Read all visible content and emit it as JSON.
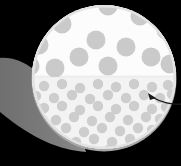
{
  "figure": {
    "name": "magnified-inset-callout",
    "width": 181,
    "height": 166,
    "background_color": "#000000"
  },
  "colors": {
    "background": "#000000",
    "lens_fill": "#fbfbfb",
    "lens_fill_lower": "#f2f2f2",
    "lens_rim_shadow": "#b4b4b4",
    "dot_large": "#cacaca",
    "dot_small": "#cdcdcd",
    "cone_wedge": "#7c7c7c",
    "cone_wedge_edge": "#8c8c8c",
    "divider_line": "#e8e8e8",
    "arrow": "#1a1a1a"
  },
  "lens": {
    "name": "magnifier-lens-circle",
    "center_x": 104,
    "center_y": 77,
    "radius": 72,
    "divider_y": 77,
    "upper_region_label": "coarse-dot-region",
    "lower_region_label": "fine-dot-region"
  },
  "cone": {
    "name": "callout-cone-wedge",
    "apex_x": 0,
    "apex_y": 112,
    "fill": "#7c7c7c"
  },
  "arrow": {
    "name": "callout-arrow",
    "start_x": 181,
    "start_y": 104,
    "tip_x": 148,
    "tip_y": 93,
    "stroke": "#1a1a1a",
    "stroke_width": 1.4,
    "head_size": 5
  },
  "dots_large": {
    "radius": 9.5,
    "fill": "#cacaca",
    "count": 13,
    "points": [
      [
        108,
        6
      ],
      [
        140,
        16
      ],
      [
        62,
        24
      ],
      [
        166,
        30
      ],
      [
        39,
        45
      ],
      [
        96,
        40
      ],
      [
        126,
        47
      ],
      [
        79,
        57
      ],
      [
        151,
        57
      ],
      [
        30,
        66
      ],
      [
        55,
        68
      ],
      [
        108,
        66
      ],
      [
        170,
        64
      ]
    ]
  },
  "dots_small": {
    "radius": 5.2,
    "fill": "#cdcdcd",
    "count": 58,
    "points": [
      [
        44,
        86
      ],
      [
        62,
        84
      ],
      [
        80,
        88
      ],
      [
        98,
        84
      ],
      [
        116,
        87
      ],
      [
        134,
        84
      ],
      [
        152,
        87
      ],
      [
        168,
        85
      ],
      [
        36,
        96
      ],
      [
        54,
        98
      ],
      [
        72,
        95
      ],
      [
        90,
        99
      ],
      [
        108,
        95
      ],
      [
        126,
        98
      ],
      [
        144,
        95
      ],
      [
        160,
        98
      ],
      [
        44,
        108
      ],
      [
        62,
        106
      ],
      [
        80,
        110
      ],
      [
        98,
        106
      ],
      [
        116,
        109
      ],
      [
        134,
        106
      ],
      [
        152,
        109
      ],
      [
        166,
        107
      ],
      [
        38,
        118
      ],
      [
        56,
        120
      ],
      [
        74,
        117
      ],
      [
        92,
        121
      ],
      [
        110,
        117
      ],
      [
        128,
        120
      ],
      [
        146,
        117
      ],
      [
        160,
        119
      ],
      [
        48,
        130
      ],
      [
        66,
        128
      ],
      [
        84,
        132
      ],
      [
        102,
        128
      ],
      [
        120,
        131
      ],
      [
        138,
        128
      ],
      [
        152,
        130
      ],
      [
        58,
        140
      ],
      [
        76,
        142
      ],
      [
        94,
        139
      ],
      [
        112,
        142
      ],
      [
        130,
        139
      ],
      [
        144,
        141
      ],
      [
        74,
        150
      ],
      [
        92,
        151
      ],
      [
        110,
        149
      ],
      [
        126,
        150
      ],
      [
        30,
        90
      ],
      [
        28,
        102
      ],
      [
        34,
        112
      ],
      [
        32,
        124
      ],
      [
        172,
        94
      ],
      [
        174,
        108
      ],
      [
        170,
        120
      ],
      [
        160,
        132
      ],
      [
        150,
        142
      ]
    ]
  }
}
